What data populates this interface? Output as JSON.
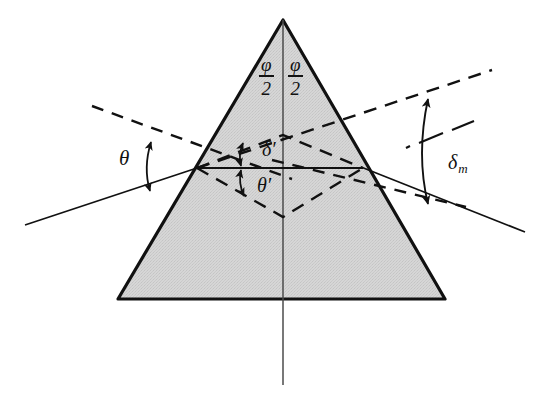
{
  "figure": {
    "background_color": "#ffffff",
    "ink_color": "#111111",
    "prism_fill_color": "#d2d2d2"
  },
  "labels": {
    "apex_left_numerator": "φ",
    "apex_left_denominator": "2",
    "apex_right_numerator": "φ",
    "apex_right_denominator": "2",
    "incidence_angle": "θ",
    "internal_deviation": "δ′",
    "internal_refraction_angle": "θ′",
    "minimum_deviation": "δ",
    "minimum_deviation_subscript": "m"
  },
  "geometry": {
    "prism": {
      "apex": [
        283,
        20
      ],
      "base_left": [
        118,
        299
      ],
      "base_right": [
        445,
        299
      ]
    },
    "entry_point": [
      197,
      168
    ],
    "exit_point": [
      363,
      168
    ],
    "internal_upper_vertex": [
      283,
      135
    ],
    "internal_lower_vertex": [
      283,
      217
    ],
    "incident_ray": [
      [
        25,
        225
      ],
      [
        197,
        168
      ]
    ],
    "exit_ray": [
      [
        363,
        168
      ],
      [
        525,
        232
      ]
    ],
    "incident_extension_dashed": [
      [
        197,
        168
      ],
      [
        492,
        70
      ]
    ],
    "entry_normal_dashed": [
      [
        90,
        105
      ],
      [
        290,
        178
      ]
    ],
    "exit_normal_dashed": [
      [
        272,
        160
      ],
      [
        462,
        205
      ]
    ],
    "dash_dot_reference": [
      [
        405,
        148
      ],
      [
        472,
        122
      ]
    ],
    "vertical_axis": [
      [
        283,
        20
      ],
      [
        283,
        385
      ]
    ]
  },
  "icons": {
    "angle_arc_theta": "double-headed-arc-arrow",
    "angle_arc_delta_prime": "double-headed-arc-arrow",
    "angle_arc_delta_m": "double-headed-arc-arrow"
  }
}
